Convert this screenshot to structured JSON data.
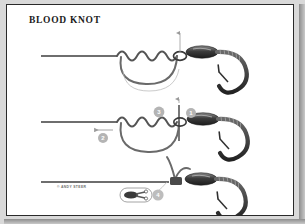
{
  "page": {
    "title": "BLOOD KNOT",
    "copyright": "© ANDY STEER",
    "background_color": "#ffffff",
    "frame_color": "#2a2a2a",
    "plate_color": "#ffffff"
  },
  "colors": {
    "line_gray": "#6e6e6e",
    "line_dark": "#4a4a4a",
    "hook_dark": "#2f2f2f",
    "badge_fill": "#b4b4b4",
    "badge_text": "#ffffff",
    "thin_guide": "#9a9a9a",
    "title_color": "#1b1b1b",
    "copyright_color": "#6f6f6f"
  },
  "steps": [
    {
      "id": "step-top",
      "name": "wrap-tag-end-around-mainline",
      "badges": [],
      "arrows": [
        "up-through-eye"
      ]
    },
    {
      "id": "step-middle",
      "name": "pass-tag-end-and-tighten",
      "badges": [
        {
          "label": "1",
          "name": "badge-one",
          "x": 184,
          "y": 108
        },
        {
          "label": "2",
          "name": "badge-two",
          "x": 96,
          "y": 133
        },
        {
          "label": "3",
          "name": "badge-three",
          "x": 152,
          "y": 107
        }
      ],
      "arrows": [
        "up-through-eye",
        "pull-left"
      ]
    },
    {
      "id": "step-bottom",
      "name": "trim-tag-end-finished-knot",
      "badges": [
        {
          "label": "4",
          "name": "badge-four",
          "x": 151,
          "y": 190
        }
      ],
      "inset": {
        "name": "trim-tool-inset",
        "label": "scissors-icon"
      }
    }
  ],
  "icons": {
    "hook": "fishing-hook-icon",
    "bait_sleeve": "bait-sleeve-icon",
    "coil": "line-coil-icon",
    "scissors": "scissors-icon",
    "arrow_up": "arrow-up-icon",
    "arrow_left": "arrow-left-icon"
  }
}
